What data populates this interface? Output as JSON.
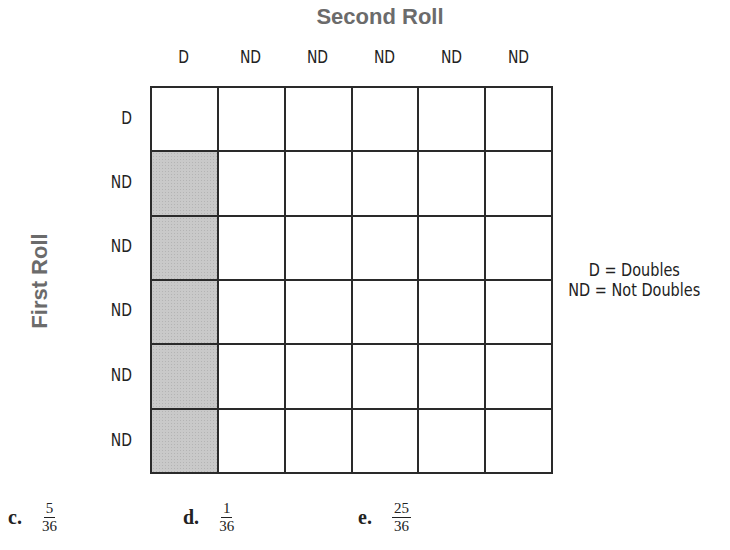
{
  "diagram": {
    "title": "Second Roll",
    "y_axis_label": "First Roll",
    "column_labels": [
      "D",
      "ND",
      "ND",
      "ND",
      "ND",
      "ND"
    ],
    "row_labels": [
      "D",
      "ND",
      "ND",
      "ND",
      "ND",
      "ND"
    ],
    "grid": {
      "rows": 6,
      "cols": 6,
      "shaded_cells": [
        [
          1,
          0
        ],
        [
          2,
          0
        ],
        [
          3,
          0
        ],
        [
          4,
          0
        ],
        [
          5,
          0
        ]
      ],
      "shade_color": "#c9c9c9",
      "line_color": "#2a2a2a"
    },
    "legend": [
      "D = Doubles",
      "ND = Not Doubles"
    ]
  },
  "answer_choices": [
    {
      "letter": "c.",
      "numerator": "5",
      "denominator": "36"
    },
    {
      "letter": "d.",
      "numerator": "1",
      "denominator": "36"
    },
    {
      "letter": "e.",
      "numerator": "25",
      "denominator": "36"
    }
  ]
}
